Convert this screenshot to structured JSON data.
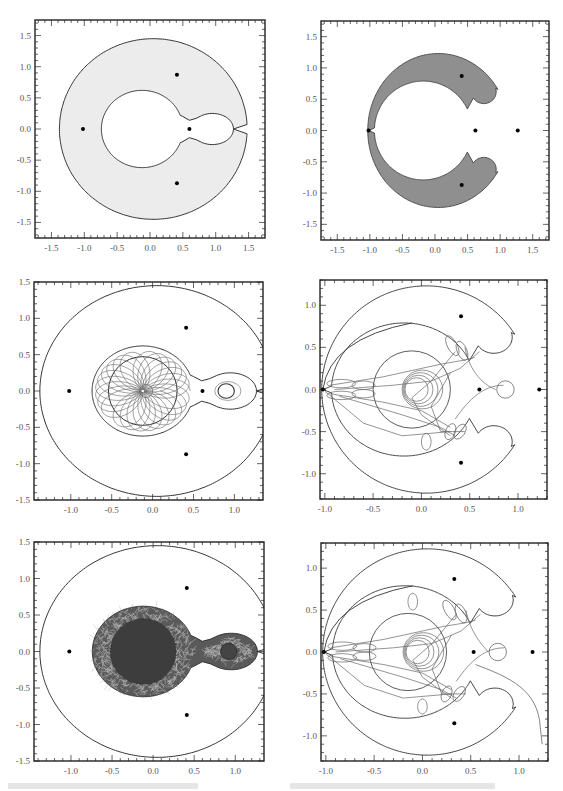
{
  "figure": {
    "colors": {
      "frame": "#222222",
      "curve": "#333333",
      "orbit": "#666666",
      "fill_light": "#ececec",
      "fill_dark": "#8f8f8f",
      "point": "#000000"
    }
  },
  "chart_data": [
    {
      "id": "panel-1",
      "type": "scatter",
      "title": "",
      "xlabel": "",
      "ylabel": "",
      "xlim": [
        -1.75,
        1.75
      ],
      "ylim": [
        -1.75,
        1.75
      ],
      "xticks": [
        "-1.5",
        "-1.0",
        "-0.5",
        "0.0",
        "0.5",
        "1.0",
        "1.5"
      ],
      "yticks": [
        "1.5",
        "1.0",
        "0.5",
        "0.0",
        "-0.5",
        "-1.0",
        "-1.5"
      ],
      "region": "light gray annulus (forbidden region) between outer oval r≈1.45 and inner keyhole curve",
      "points": [
        [
          -1.02,
          0.0
        ],
        [
          0.41,
          0.87
        ],
        [
          0.41,
          -0.87
        ],
        [
          0.6,
          0.0
        ]
      ],
      "grid": false
    },
    {
      "id": "panel-2",
      "type": "scatter",
      "xlim": [
        -1.75,
        1.75
      ],
      "ylim": [
        -1.75,
        1.75
      ],
      "xticks": [
        "-1.5",
        "-1.0",
        "-0.5",
        "0.0",
        "0.5",
        "1.0",
        "1.5"
      ],
      "yticks": [
        "1.5",
        "1.0",
        "0.5",
        "0.0",
        "-0.5",
        "-1.0",
        "-1.5"
      ],
      "region": "dark gray C-shaped (horseshoe) region split at x≈-1.0",
      "points": [
        [
          -1.02,
          0.0
        ],
        [
          0.41,
          0.87
        ],
        [
          0.41,
          -0.87
        ],
        [
          0.62,
          0.0
        ],
        [
          1.27,
          0.0
        ]
      ],
      "grid": false
    },
    {
      "id": "panel-3",
      "type": "line",
      "xlim": [
        -1.45,
        1.35
      ],
      "ylim": [
        -1.5,
        1.5
      ],
      "xticks": [
        "-1.0",
        "-0.5",
        "0.0",
        "0.5",
        "1.0"
      ],
      "yticks": [
        "1.5",
        "1.0",
        "0.5",
        "0.0",
        "-0.5",
        "-1.0",
        "-1.5"
      ],
      "description": "Outer oval boundary, inner keyhole boundary, circle r≈0.4 about (-0.1,0), rosette orbit, small loops near (0.9,0)",
      "points": [
        [
          -1.02,
          0.0
        ],
        [
          0.41,
          0.87
        ],
        [
          0.41,
          -0.87
        ],
        [
          0.61,
          0.0
        ]
      ],
      "grid": false
    },
    {
      "id": "panel-4",
      "type": "line",
      "xlim": [
        -1.05,
        1.3
      ],
      "ylim": [
        -1.3,
        1.3
      ],
      "xticks": [
        "-1.0",
        "-0.5",
        "0.0",
        "0.5",
        "1.0"
      ],
      "yticks": [
        "1.0",
        "0.5",
        "0.0",
        "-0.5",
        "-1.0"
      ],
      "description": "Horseshoe boundary outlines, circle r≈0.4 about (-0.1,0), looping trajectory with lobes and small loop near (0.85,0)",
      "points": [
        [
          -1.02,
          0.0
        ],
        [
          0.41,
          0.87
        ],
        [
          0.41,
          -0.87
        ],
        [
          0.6,
          0.0
        ],
        [
          1.22,
          0.0
        ]
      ],
      "grid": false
    },
    {
      "id": "panel-5",
      "type": "line",
      "xlim": [
        -1.45,
        1.35
      ],
      "ylim": [
        -1.5,
        1.5
      ],
      "xticks": [
        "-1.0",
        "-0.5",
        "0.0",
        "0.5",
        "1.0"
      ],
      "yticks": [
        "1.5",
        "1.0",
        "0.5",
        "0.0",
        "-0.5",
        "-1.0",
        "-1.5"
      ],
      "description": "Dense chaotic orbit filling the keyhole allowed region, outer oval boundary",
      "points": [
        [
          -1.02,
          0.0
        ],
        [
          0.41,
          0.87
        ],
        [
          0.41,
          -0.87
        ]
      ],
      "grid": false
    },
    {
      "id": "panel-6",
      "type": "line",
      "xlim": [
        -1.05,
        1.3
      ],
      "ylim": [
        -1.3,
        1.3
      ],
      "xticks": [
        "-1.0",
        "-0.5",
        "0.0",
        "0.5",
        "1.0"
      ],
      "yticks": [
        "1.0",
        "0.5",
        "0.0",
        "-0.5",
        "-1.0"
      ],
      "description": "Horseshoe boundaries, circle about (-0.15,0), looping trajectory escaping toward bottom right",
      "points": [
        [
          -1.02,
          0.0
        ],
        [
          0.33,
          0.87
        ],
        [
          0.33,
          -0.85
        ],
        [
          0.53,
          0.0
        ],
        [
          1.14,
          0.0
        ]
      ],
      "grid": false
    }
  ]
}
